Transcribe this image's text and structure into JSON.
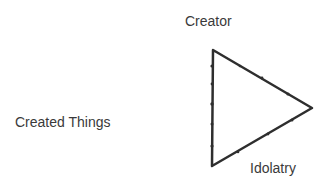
{
  "diagram": {
    "type": "triangle",
    "labels": {
      "creator": "Creator",
      "created_things": "Created Things",
      "idolatry": "Idolatry"
    },
    "triangle": {
      "points": "213,50 312,108 212,166",
      "stroke": "#2e2e2e",
      "stroke_width": 2.5
    },
    "colors": {
      "background": "#ffffff",
      "text": "#3a3a3a",
      "stroke": "#2e2e2e"
    }
  }
}
